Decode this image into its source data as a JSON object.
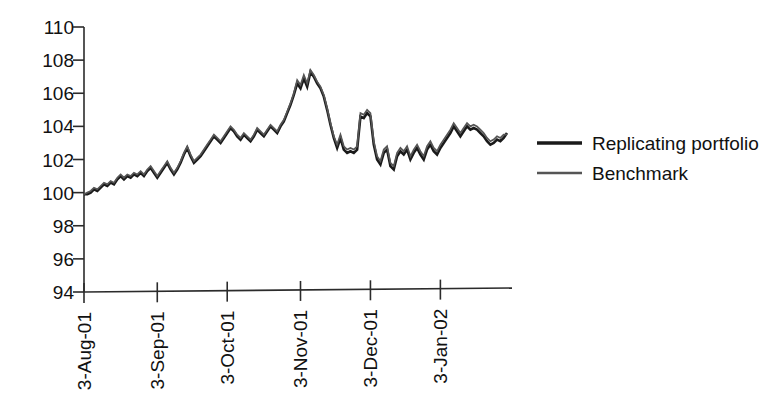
{
  "chart_data": {
    "type": "line",
    "title": "",
    "xlabel": "",
    "ylabel": "",
    "ylim": [
      94,
      110
    ],
    "ytick_values": [
      94,
      96,
      98,
      100,
      102,
      104,
      106,
      108,
      110
    ],
    "ytick_labels": [
      "94",
      "96",
      "98",
      "100",
      "102",
      "104",
      "106",
      "108",
      "110"
    ],
    "grid": false,
    "legend_position": "right",
    "xtick_labels": [
      "3-Aug-01",
      "3-Sep-01",
      "3-Oct-01",
      "3-Nov-01",
      "3-Dec-01",
      "3-Jan-02"
    ],
    "xtick_indices": [
      0,
      22,
      43,
      65,
      86,
      107
    ],
    "x_count": 128,
    "series": [
      {
        "name": "Replicating portfolio",
        "color": "#1a1a1a",
        "width": 2.6,
        "values": [
          99.9,
          99.9,
          100.0,
          100.2,
          100.1,
          100.3,
          100.5,
          100.4,
          100.6,
          100.5,
          100.8,
          101.0,
          100.8,
          101.0,
          100.9,
          101.1,
          101.0,
          101.2,
          101.0,
          101.3,
          101.5,
          101.2,
          100.9,
          101.2,
          101.5,
          101.8,
          101.4,
          101.1,
          101.4,
          101.8,
          102.3,
          102.7,
          102.2,
          101.8,
          102.0,
          102.2,
          102.5,
          102.8,
          103.1,
          103.4,
          103.2,
          103.0,
          103.3,
          103.6,
          103.9,
          103.7,
          103.4,
          103.2,
          103.5,
          103.3,
          103.1,
          103.4,
          103.8,
          103.6,
          103.4,
          103.7,
          104.0,
          103.8,
          103.6,
          104.0,
          104.3,
          104.8,
          105.3,
          105.9,
          106.6,
          106.3,
          106.9,
          106.4,
          107.3,
          107.0,
          106.6,
          106.3,
          105.8,
          105.0,
          104.1,
          103.3,
          102.7,
          103.3,
          102.6,
          102.4,
          102.5,
          102.4,
          102.6,
          104.6,
          104.5,
          104.8,
          104.6,
          102.9,
          102.0,
          101.7,
          102.4,
          102.6,
          101.6,
          101.4,
          102.2,
          102.5,
          102.3,
          102.6,
          102.0,
          102.4,
          102.7,
          102.3,
          102.0,
          102.6,
          102.9,
          102.5,
          102.3,
          102.7,
          103.0,
          103.3,
          103.6,
          104.0,
          103.7,
          103.4,
          103.7,
          104.0,
          103.8,
          103.9,
          103.8,
          103.6,
          103.4,
          103.1,
          102.9,
          103.0,
          103.2,
          103.1,
          103.3,
          103.6
        ]
      },
      {
        "name": "Benchmark",
        "color": "#555555",
        "width": 1.7,
        "values": [
          99.9,
          100.0,
          100.1,
          100.3,
          100.2,
          100.4,
          100.6,
          100.5,
          100.7,
          100.6,
          100.9,
          101.1,
          100.9,
          101.1,
          101.0,
          101.2,
          101.1,
          101.3,
          101.1,
          101.4,
          101.6,
          101.3,
          101.0,
          101.3,
          101.6,
          101.9,
          101.5,
          101.2,
          101.5,
          101.9,
          102.4,
          102.8,
          102.3,
          101.9,
          102.1,
          102.3,
          102.6,
          102.9,
          103.2,
          103.5,
          103.3,
          103.1,
          103.4,
          103.7,
          104.0,
          103.8,
          103.5,
          103.3,
          103.6,
          103.4,
          103.2,
          103.5,
          103.9,
          103.7,
          103.5,
          103.8,
          104.1,
          103.9,
          103.7,
          104.1,
          104.4,
          104.9,
          105.4,
          106.0,
          106.8,
          106.5,
          107.1,
          106.6,
          107.4,
          107.1,
          106.7,
          106.4,
          105.9,
          105.1,
          104.2,
          103.4,
          102.9,
          103.5,
          102.8,
          102.6,
          102.7,
          102.6,
          102.8,
          104.8,
          104.7,
          105.0,
          104.8,
          103.1,
          102.2,
          101.9,
          102.6,
          102.8,
          101.8,
          101.6,
          102.4,
          102.7,
          102.5,
          102.8,
          102.2,
          102.6,
          102.9,
          102.5,
          102.2,
          102.8,
          103.1,
          102.7,
          102.5,
          102.9,
          103.2,
          103.5,
          103.8,
          104.2,
          103.9,
          103.6,
          103.9,
          104.2,
          104.0,
          104.1,
          104.0,
          103.8,
          103.6,
          103.3,
          103.1,
          103.2,
          103.4,
          103.3,
          103.5,
          103.5
        ]
      }
    ]
  },
  "legend": {
    "entries": [
      {
        "label": "Replicating portfolio"
      },
      {
        "label": "Benchmark"
      }
    ]
  }
}
